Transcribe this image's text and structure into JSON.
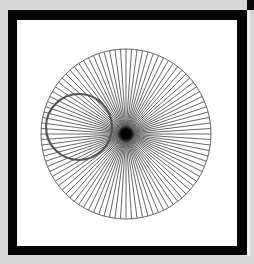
{
  "figure": {
    "background_color": "#d8d8d8",
    "frame_color": "#050505",
    "canvas_color": "#ffffff",
    "main_circle": {
      "cx": 126,
      "cy": 134,
      "r": 85,
      "stroke": "#666666",
      "stroke_width": 1,
      "spoke_count": 96,
      "spoke_color": "#555555"
    },
    "small_circle": {
      "cx": 79,
      "cy": 127,
      "r": 33,
      "stroke": "#555555",
      "stroke_width": 2.2
    },
    "center_hub": {
      "cx": 126,
      "cy": 134,
      "r": 9,
      "color": "#000000"
    }
  }
}
